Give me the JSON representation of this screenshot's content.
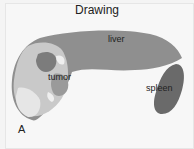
{
  "title": "Drawing",
  "labels": {
    "liver": "liver",
    "tumor": "tumor",
    "spleen": "spleen"
  },
  "panel_letter": "A",
  "colors": {
    "liver": "#8f8f8f",
    "liver_light": "#cfcfcf",
    "tumor_dark": "#7a7a7a",
    "spleen": "#6a6a6a",
    "background": "#f7f7f7"
  }
}
